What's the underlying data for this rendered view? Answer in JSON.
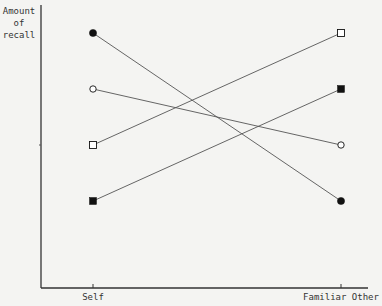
{
  "chart_data": {
    "type": "line",
    "title": "",
    "xlabel": "",
    "ylabel": "Amount of recall",
    "ylabel_lines": [
      "Amount",
      "of",
      "recall"
    ],
    "categories": [
      "Self",
      "Familiar Other"
    ],
    "y_ticks_labeled": false,
    "ylim": [
      0,
      10
    ],
    "grid": false,
    "legend": null,
    "series": [
      {
        "name": "filled-circle",
        "marker": "circle-filled",
        "values": [
          9,
          3
        ]
      },
      {
        "name": "open-circle",
        "marker": "circle-open",
        "values": [
          7,
          5
        ]
      },
      {
        "name": "open-square",
        "marker": "square-open",
        "values": [
          5,
          9
        ]
      },
      {
        "name": "filled-square",
        "marker": "square-filled",
        "values": [
          3,
          7
        ]
      }
    ]
  },
  "colors": {
    "background": "#f4f4f2",
    "axis": "#333333",
    "line": "#555555",
    "marker": "#111111"
  }
}
